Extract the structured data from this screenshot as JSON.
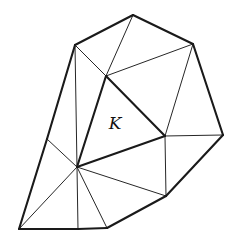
{
  "diagram": {
    "type": "triangulated-mesh",
    "element_label": "K",
    "label_position": [
      115,
      129
    ],
    "colors": {
      "stroke": "#1a1a1a",
      "background": "#ffffff"
    },
    "vertices": {
      "top": [
        133,
        15
      ],
      "upper_left": [
        75,
        45
      ],
      "upper_right": [
        193,
        44
      ],
      "right": [
        223,
        135
      ],
      "lower_right": [
        166,
        196
      ],
      "bottom_right": [
        107,
        228
      ],
      "bottom_mid": [
        78,
        229
      ],
      "bottom_left": [
        19,
        229
      ],
      "left_edge_mid": [
        47,
        139
      ],
      "k_top": [
        106,
        76
      ],
      "k_right": [
        165,
        136
      ],
      "hub": [
        77,
        167
      ]
    },
    "boundary_edges": [
      [
        "top",
        "upper_left"
      ],
      [
        "top",
        "upper_right"
      ],
      [
        "upper_right",
        "right"
      ],
      [
        "right",
        "lower_right"
      ],
      [
        "lower_right",
        "bottom_right"
      ],
      [
        "bottom_right",
        "bottom_mid"
      ],
      [
        "bottom_mid",
        "bottom_left"
      ],
      [
        "bottom_left",
        "left_edge_mid"
      ],
      [
        "left_edge_mid",
        "upper_left"
      ]
    ],
    "highlighted_element_edges": [
      [
        "k_top",
        "k_right"
      ],
      [
        "k_right",
        "hub"
      ],
      [
        "hub",
        "k_top"
      ]
    ],
    "interior_edges": [
      [
        "upper_left",
        "k_top"
      ],
      [
        "top",
        "k_top"
      ],
      [
        "k_top",
        "upper_right"
      ],
      [
        "upper_right",
        "k_right"
      ],
      [
        "k_right",
        "right"
      ],
      [
        "k_right",
        "lower_right"
      ],
      [
        "hub",
        "lower_right"
      ],
      [
        "hub",
        "bottom_right"
      ],
      [
        "hub",
        "bottom_left"
      ],
      [
        "hub",
        "left_edge_mid"
      ],
      [
        "upper_left",
        "hub"
      ],
      [
        "hub",
        "bottom_mid"
      ]
    ]
  }
}
